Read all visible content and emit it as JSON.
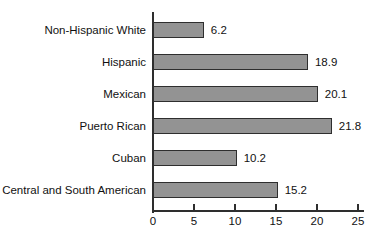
{
  "chart_data": {
    "type": "bar",
    "orientation": "horizontal",
    "categories": [
      "Non-Hispanic White",
      "Hispanic",
      "Mexican",
      "Puerto Rican",
      "Cuban",
      "Central and South American"
    ],
    "values": [
      6.2,
      18.9,
      20.1,
      21.8,
      10.2,
      15.2
    ],
    "value_labels": [
      "6.2",
      "18.9",
      "20.1",
      "21.8",
      "10.2",
      "15.2"
    ],
    "xticks": [
      "0",
      "5",
      "10",
      "15",
      "20",
      "25"
    ],
    "xlim": [
      0,
      25
    ],
    "grid": false,
    "legend": false,
    "data_labels_position": "right-of-bar",
    "colors": {
      "bar_fill": "#939393",
      "bar_border": "#2e2e2e",
      "axis": "#2e2e2e",
      "text": "#111111",
      "background": "#ffffff"
    }
  }
}
